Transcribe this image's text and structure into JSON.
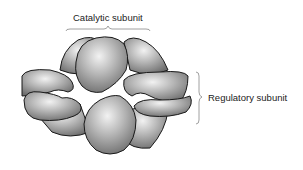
{
  "diagram": {
    "labels": {
      "catalytic": "Catalytic subunit",
      "regulatory": "Regulatory subunit"
    },
    "colors": {
      "subunit_fill": "#9a9a9a",
      "subunit_highlight": "#e6e6e6",
      "outline": "#1a1a1a",
      "bracket": "#888888",
      "text": "#222222"
    }
  }
}
